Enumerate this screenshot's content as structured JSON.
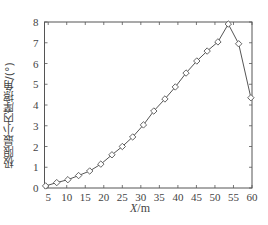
{
  "chart_data": {
    "type": "line",
    "title": "",
    "xlabel": "X/m",
    "ylabel": "极限最小内摩擦角/(°)",
    "xlim": [
      4,
      60
    ],
    "ylim": [
      0,
      8
    ],
    "xticks": [
      5,
      10,
      15,
      20,
      25,
      30,
      35,
      40,
      45,
      50,
      55,
      60
    ],
    "yticks": [
      0,
      1,
      2,
      3,
      4,
      5,
      6,
      7,
      8
    ],
    "grid": false,
    "legend": null,
    "marker": "diamond",
    "series": [
      {
        "name": "极限最小内摩擦角",
        "x": [
          4.3,
          7.3,
          10.3,
          13.2,
          16.2,
          19.2,
          22.2,
          25.0,
          27.8,
          30.7,
          33.5,
          36.5,
          39.3,
          42.2,
          45.1,
          47.9,
          50.8,
          53.6,
          56.4,
          59.7
        ],
        "values": [
          0.1,
          0.26,
          0.4,
          0.6,
          0.82,
          1.15,
          1.6,
          2.0,
          2.46,
          3.04,
          3.71,
          4.29,
          4.87,
          5.54,
          6.12,
          6.6,
          7.04,
          7.9,
          6.95,
          4.35
        ]
      }
    ]
  },
  "labels": {
    "x": "X/m",
    "y": "极限最小内摩擦角/(°)"
  }
}
